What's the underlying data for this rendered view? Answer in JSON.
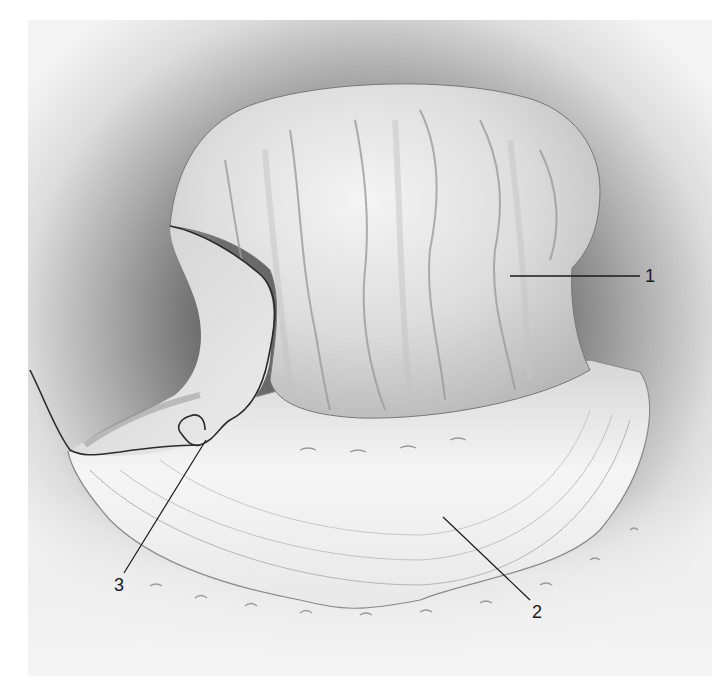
{
  "figure": {
    "labels": [
      {
        "id": "1",
        "text": "1"
      },
      {
        "id": "2",
        "text": "2"
      },
      {
        "id": "3",
        "text": "3"
      }
    ]
  },
  "colors": {
    "background": "#ffffff",
    "shadow": "#5c5c5c",
    "body": "#e6e6e6",
    "line": "#1a1a1a"
  }
}
